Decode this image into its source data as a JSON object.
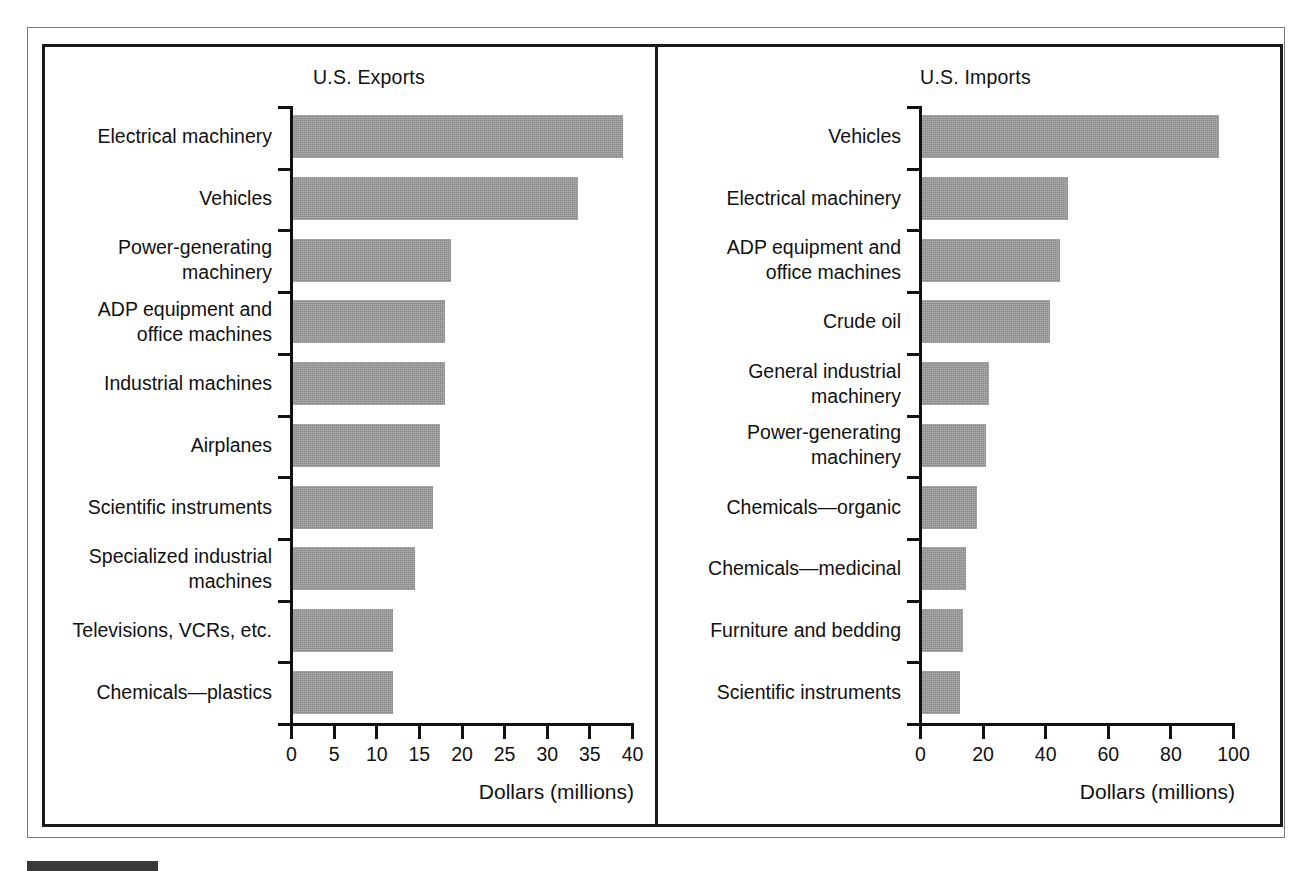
{
  "figure": {
    "background_color": "#ffffff",
    "bar_color": "#8b8b8b",
    "axis_color": "#111111",
    "frame_color": "#1a1a1a"
  },
  "chart_data": [
    {
      "type": "bar",
      "orientation": "horizontal",
      "title": "U.S. Exports",
      "xlabel": "Dollars (millions)",
      "ylabel": "",
      "xlim": [
        0,
        40
      ],
      "xticks": [
        0,
        5,
        10,
        15,
        20,
        25,
        30,
        35,
        40
      ],
      "xticklabels": [
        "0",
        "5",
        "10",
        "15",
        "20",
        "25",
        "30",
        "35",
        "40"
      ],
      "grid": false,
      "legend": null,
      "categories": [
        "Electrical machinery",
        "Vehicles",
        "Power-generating\nmachinery",
        "ADP equipment and\noffice machines",
        "Industrial machines",
        "Airplanes",
        "Scientific instruments",
        "Specialized industrial\nmachines",
        "Televisions, VCRs, etc.",
        "Chemicals—plastics"
      ],
      "values": [
        38.7,
        33.4,
        18.5,
        17.8,
        17.8,
        17.2,
        16.4,
        14.3,
        11.7,
        11.7
      ]
    },
    {
      "type": "bar",
      "orientation": "horizontal",
      "title": "U.S. Imports",
      "xlabel": "Dollars (millions)",
      "ylabel": "",
      "xlim": [
        0,
        100
      ],
      "xticks": [
        0,
        20,
        40,
        60,
        80,
        100
      ],
      "xticklabels": [
        "0",
        "20",
        "40",
        "60",
        "80",
        "100"
      ],
      "grid": false,
      "legend": null,
      "categories": [
        "Vehicles",
        "Electrical machinery",
        "ADP equipment and\noffice machines",
        "Crude oil",
        "General industrial\nmachinery",
        "Power-generating\nmachinery",
        "Chemicals—organic",
        "Chemicals—medicinal",
        "Furniture and bedding",
        "Scientific instruments"
      ],
      "values": [
        95.0,
        46.5,
        44.0,
        41.0,
        21.5,
        20.5,
        17.5,
        14.0,
        13.0,
        12.0
      ]
    }
  ]
}
